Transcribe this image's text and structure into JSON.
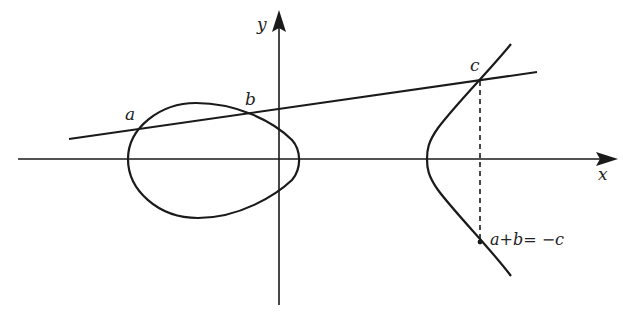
{
  "diagram": {
    "axes": {
      "x_label": "x",
      "y_label": "y"
    },
    "points": [
      {
        "id": "a",
        "label": "a"
      },
      {
        "id": "b",
        "label": "b"
      },
      {
        "id": "c",
        "label": "c"
      },
      {
        "id": "neg_c",
        "label": "a+b= −c"
      }
    ],
    "colors": {
      "stroke": "#1a1a1a",
      "background": "#ffffff"
    }
  }
}
